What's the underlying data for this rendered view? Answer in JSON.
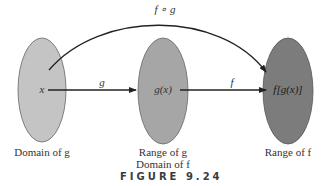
{
  "figure": {
    "caption": "FIGURE 9.24",
    "colors": {
      "domain_fill": "#c4c4c4",
      "middle_fill": "#a6a6a6",
      "range_fill": "#7c7c7c",
      "stroke": "#555555",
      "arrow": "#222222"
    },
    "sets": [
      {
        "element": "x",
        "label_lines": [
          "Domain of g"
        ]
      },
      {
        "element": "g(x)",
        "label_lines": [
          "Range of g",
          "Domain of f"
        ]
      },
      {
        "element": "f[g(x)]",
        "label_lines": [
          "Range of f"
        ]
      }
    ],
    "arrows": [
      {
        "label": "g",
        "from": "x",
        "to": "g(x)"
      },
      {
        "label": "f",
        "from": "g(x)",
        "to": "f[g(x)]"
      },
      {
        "label": "f ∘ g",
        "from": "x",
        "to": "f[g(x)]"
      }
    ]
  }
}
